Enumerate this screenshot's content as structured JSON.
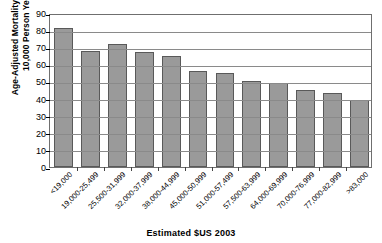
{
  "chart_data": {
    "type": "bar",
    "title": "",
    "xlabel": "Estimated $US 2003",
    "ylabel": "Age-Adjusted Mortality Rate per 10,000 Person Years",
    "ylabel_line1": "Age-Adjusted Mortality Rate per",
    "ylabel_line2": "10,000 Person Years",
    "ylim": [
      0,
      90
    ],
    "ytick_step": 10,
    "yticks": [
      0,
      10,
      20,
      30,
      40,
      50,
      60,
      70,
      80,
      90
    ],
    "ytick_labels": [
      "0",
      "10",
      "20",
      "30",
      "40",
      "50",
      "60",
      "70",
      "80",
      "90"
    ],
    "grid": true,
    "grid_axis": "y",
    "legend": false,
    "categories": [
      "<19,000",
      "19,000-25,499",
      "25,500-31,999",
      "32,000-37,999",
      "38,000-44,999",
      "45,000-50,999",
      "51,000-57,499",
      "57,500-63,999",
      "64,000-69,999",
      "70,000-76,999",
      "77,000-82,999",
      ">83,000"
    ],
    "values": [
      81,
      68,
      72,
      67,
      65,
      56,
      55,
      50,
      49,
      45,
      43.5,
      39
    ],
    "bar_color": "#9a9a9a",
    "bar_edge_color": "#595959",
    "grid_color": "#8a8a8a",
    "axis_color": "#6f6f6f",
    "background": "#ffffff"
  }
}
